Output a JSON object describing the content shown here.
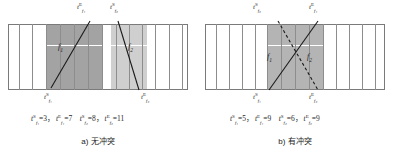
{
  "figure": {
    "panels": [
      {
        "id": "panel-a",
        "caption": "a) 无冲突",
        "top_labels": [
          {
            "name": "t-f1-end",
            "base": "t",
            "sub": "f₁",
            "sup": "E",
            "x": 77,
            "y": 2
          },
          {
            "name": "t-f2-start",
            "base": "t",
            "sub": "f₂",
            "sup": "S",
            "x": 110,
            "y": 2
          }
        ],
        "bottom_labels": [
          {
            "name": "t-f1-start",
            "base": "t",
            "sub": "f₁",
            "sup": "S",
            "x": 44,
            "y": 92
          },
          {
            "name": "t-f2-end",
            "base": "t",
            "sub": "f₂",
            "sup": "E",
            "x": 141,
            "y": 92
          }
        ],
        "flight_labels": [
          {
            "name": "flight-f1",
            "text": "f",
            "sub": "1",
            "x": 58,
            "y": 42
          },
          {
            "name": "flight-f2",
            "text": "f",
            "sub": "2",
            "x": 128,
            "y": 42
          }
        ],
        "values_line": {
          "items": [
            {
              "base": "t",
              "sub": "f₁",
              "sup": "S",
              "value": "3"
            },
            {
              "base": "t",
              "sub": "f₁",
              "sup": "E",
              "value": "7"
            },
            {
              "base": "t",
              "sub": "f₂",
              "sup": "S",
              "value": "8"
            },
            {
              "base": "t",
              "sub": "f₂",
              "sup": "E",
              "value": "11"
            }
          ]
        }
      },
      {
        "id": "panel-b",
        "caption": "b) 有冲突",
        "top_labels": [
          {
            "name": "t-f2-start",
            "base": "t",
            "sub": "f₂",
            "sup": "S",
            "x": 56,
            "y": 2
          },
          {
            "name": "t-f1-end",
            "base": "t",
            "sub": "f₁",
            "sup": "E",
            "x": 112,
            "y": 2
          }
        ],
        "bottom_labels": [
          {
            "name": "t-f1-start",
            "base": "t",
            "sub": "f₁",
            "sup": "S",
            "x": 56,
            "y": 92
          },
          {
            "name": "t-f2-end",
            "base": "t",
            "sub": "f₂",
            "sup": "E",
            "x": 112,
            "y": 92
          }
        ],
        "flight_labels": [
          {
            "name": "flight-f1",
            "text": "f",
            "sub": "1",
            "x": 70,
            "y": 52
          },
          {
            "name": "flight-f2",
            "text": "f",
            "sub": "2",
            "x": 110,
            "y": 52
          }
        ],
        "values_line": {
          "items": [
            {
              "base": "t",
              "sub": "f₁",
              "sup": "S",
              "value": "5"
            },
            {
              "base": "t",
              "sub": "f₁",
              "sup": "E",
              "value": "9"
            },
            {
              "base": "t",
              "sub": "f₂",
              "sup": "S",
              "value": "6"
            },
            {
              "base": "t",
              "sub": "f₂",
              "sup": "E",
              "value": "9"
            }
          ]
        }
      }
    ],
    "colors": {
      "band_dark": "#a3a3a3",
      "band_light": "#cfcfcf",
      "band_mid": "#b4b4b4",
      "grid_line": "#8d8d8d",
      "border": "#7a7a7a",
      "trajectory": "#1a1a1a",
      "white_divider": "#ffffff"
    }
  }
}
